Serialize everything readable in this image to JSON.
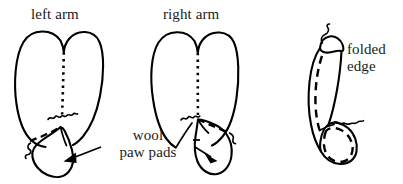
{
  "page": {
    "width": 403,
    "height": 184,
    "background_color": "#ffffff",
    "ink_color": "#000000",
    "style": "hand-drawn line art"
  },
  "labels": {
    "left_arm": "left arm",
    "right_arm": "right arm",
    "folded_edge": "folded edge",
    "wool_paw_pads_line1": "wool",
    "wool_paw_pads_line2": "paw pads"
  },
  "figures": [
    {
      "id": "left-arm",
      "label": "left arm",
      "description": "heart-shaped mitten outline with dotted center seam and wool paw pad at lower left"
    },
    {
      "id": "right-arm",
      "label": "right arm",
      "description": "heart-shaped mitten outline with dotted center seam and wool paw pad at lower right"
    },
    {
      "id": "folded-edge",
      "label": "folded edge",
      "description": "tilted tube shape with dashed fold line and dashed paw pad at bottom"
    }
  ],
  "annotations": [
    {
      "id": "wool-paw-pads",
      "text": "wool paw pads",
      "pointers": 2,
      "targets": [
        "left-arm-paw-pad",
        "right-arm-paw-pad"
      ]
    },
    {
      "id": "folded-edge-note",
      "text": "folded edge",
      "pointers": 0,
      "targets": [
        "folded-edge-figure"
      ]
    }
  ]
}
